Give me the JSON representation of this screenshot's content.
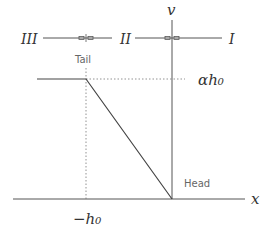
{
  "diagram": {
    "axes": {
      "x_label": "x",
      "y_label": "v"
    },
    "regions": [
      "III",
      "II",
      "I"
    ],
    "points": {
      "tail_label": "Tail",
      "head_label": "Head"
    },
    "annotations": {
      "level": "αh₀",
      "position": "−h₀"
    },
    "colors": {
      "line": "#444444",
      "dotted": "#777777",
      "text": "#333333"
    }
  }
}
